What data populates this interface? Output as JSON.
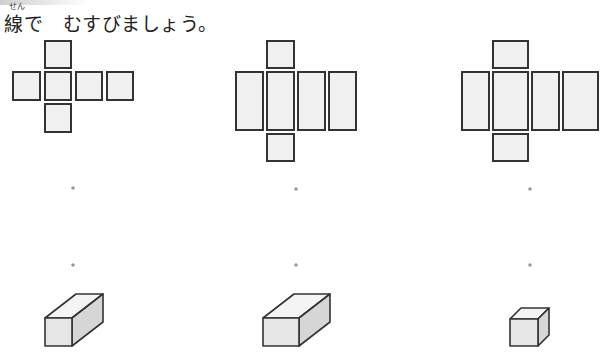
{
  "instruction": {
    "ruby": "せん",
    "text": "線で　むすびましょう。"
  },
  "exercise": {
    "nets": [
      {
        "id": "net-1",
        "description": "cube net (cross shape, 6 squares)"
      },
      {
        "id": "net-2",
        "description": "rectangular prism net, 4 tall rectangles with square ends"
      },
      {
        "id": "net-3",
        "description": "rectangular prism net, 4 rectangles of mixed widths with end faces"
      }
    ],
    "match_points": {
      "top_row_count": 3,
      "bottom_row_count": 3
    },
    "solids": [
      {
        "id": "solid-1",
        "description": "long square prism"
      },
      {
        "id": "solid-2",
        "description": "wide rectangular prism"
      },
      {
        "id": "solid-3",
        "description": "cube"
      }
    ]
  }
}
